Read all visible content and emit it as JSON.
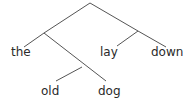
{
  "diagram": {
    "type": "syntax-tree",
    "words": {
      "w1": "the",
      "w2": "old",
      "w3": "dog",
      "w4": "lay",
      "w5": "down"
    },
    "line_color": "#555555"
  }
}
